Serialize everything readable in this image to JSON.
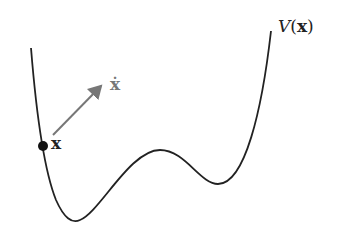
{
  "diagram": {
    "type": "potential-energy-landscape",
    "curve_label": "V(x)",
    "curve_label_parts": {
      "func": "V",
      "open": "(",
      "arg": "x",
      "close": ")"
    },
    "point_label": "x",
    "velocity_label": "ẋ",
    "colors": {
      "curve": "#222222",
      "arrow": "#777777",
      "point": "#111111"
    }
  }
}
